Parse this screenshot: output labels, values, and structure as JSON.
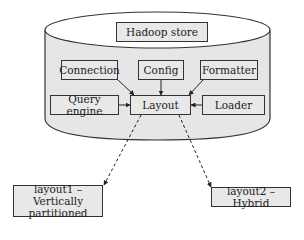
{
  "diagram": {
    "container": {
      "label": "Hadoop store",
      "shape": "cylinder"
    },
    "components": {
      "connection": "Connection",
      "config": "Config",
      "formatter": "Formatter",
      "query_engine": "Query engine",
      "layout": "Layout",
      "loader": "Loader"
    },
    "outputs": {
      "layout1": "layout1 – Vertically partitioned",
      "layout2": "layout2 – Hybrid"
    },
    "edges": [
      {
        "from": "Connection",
        "to": "Layout",
        "style": "solid"
      },
      {
        "from": "Config",
        "to": "Layout",
        "style": "solid"
      },
      {
        "from": "Formatter",
        "to": "Layout",
        "style": "solid"
      },
      {
        "from": "Query engine",
        "to": "Layout",
        "style": "solid"
      },
      {
        "from": "Loader",
        "to": "Layout",
        "style": "solid"
      },
      {
        "from": "Layout",
        "to": "layout1 – Vertically partitioned",
        "style": "dashed"
      },
      {
        "from": "Layout",
        "to": "layout2 – Hybrid",
        "style": "dashed"
      }
    ],
    "colors": {
      "fill": "#e8e8e8",
      "stroke": "#333333",
      "background": "#ffffff"
    }
  }
}
